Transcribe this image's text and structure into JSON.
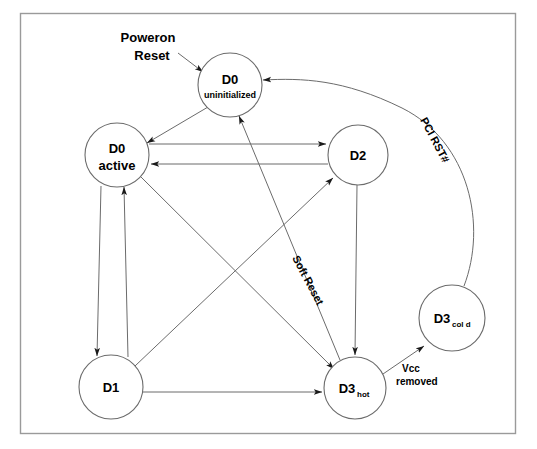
{
  "figure": {
    "frame": {
      "x": 20,
      "y": 13,
      "width": 496,
      "height": 421,
      "border_color": "#9a9a9a",
      "background": "#ffffff"
    },
    "stroke_color": "#6b6b6b",
    "node_stroke_color": "#6b6b6b",
    "text_color": "#000000"
  },
  "nodes": [
    {
      "id": "d0-uninitialized",
      "cx": 230,
      "cy": 85,
      "r": 32,
      "line1": "D0",
      "line2": "uninitialized",
      "line1_size": 13,
      "line2_size": 9
    },
    {
      "id": "d0-active",
      "cx": 117,
      "cy": 155,
      "r": 32,
      "line1": "D0",
      "line2": "active",
      "line1_size": 13,
      "line2_size": 13
    },
    {
      "id": "d2",
      "cx": 358,
      "cy": 155,
      "r": 30,
      "line1": "D2",
      "line2": "",
      "line1_size": 13,
      "line2_size": 0
    },
    {
      "id": "d3-cold",
      "cx": 452,
      "cy": 318,
      "r": 33,
      "line1": "D3",
      "line2": "",
      "subscript": "col d",
      "line1_size": 13,
      "line2_size": 0
    },
    {
      "id": "d1",
      "cx": 111,
      "cy": 387,
      "r": 32,
      "line1": "D1",
      "line2": "",
      "line1_size": 13,
      "line2_size": 0
    },
    {
      "id": "d3-hot",
      "cx": 355,
      "cy": 388,
      "r": 31,
      "line1": "D3",
      "line2": "",
      "subscript": "hot",
      "line1_size": 13,
      "line2_size": 0
    }
  ],
  "labels": [
    {
      "id": "poweron-reset",
      "line1": "Poweron",
      "line2": "Reset",
      "x": 148,
      "y": 42,
      "size": 13,
      "rotation": 0
    },
    {
      "id": "pci-rst",
      "text": "PCI RST#",
      "x": 420,
      "y": 120,
      "size": 11,
      "rotation": 62
    },
    {
      "id": "soft-reset",
      "text": "Soft Reset",
      "x": 292,
      "y": 258,
      "size": 11,
      "rotation": 62
    },
    {
      "id": "vcc-removed",
      "line1": "Vcc",
      "line2": "removed",
      "x": 402,
      "y": 372,
      "size": 10,
      "rotation": 0
    }
  ],
  "edges": [
    {
      "id": "poweron-reset-to-d0-uninitialized",
      "from": "entry",
      "to": "d0-uninitialized",
      "label": "Poweron Reset"
    },
    {
      "id": "d0-uninitialized-to-d0-active",
      "from": "d0-uninitialized",
      "to": "d0-active",
      "label": ""
    },
    {
      "id": "d0-active-to-d2",
      "from": "d0-active",
      "to": "d2",
      "label": ""
    },
    {
      "id": "d2-to-d0-active",
      "from": "d2",
      "to": "d0-active",
      "label": ""
    },
    {
      "id": "d0-active-to-d1",
      "from": "d0-active",
      "to": "d1",
      "label": ""
    },
    {
      "id": "d1-to-d0-active",
      "from": "d1",
      "to": "d0-active",
      "label": ""
    },
    {
      "id": "d0-active-to-d3-hot",
      "from": "d0-active",
      "to": "d3-hot",
      "label": "Soft Reset"
    },
    {
      "id": "d1-to-d2",
      "from": "d1",
      "to": "d2",
      "label": ""
    },
    {
      "id": "d1-to-d3-hot",
      "from": "d1",
      "to": "d3-hot",
      "label": ""
    },
    {
      "id": "d2-to-d3-hot",
      "from": "d2",
      "to": "d3-hot",
      "label": ""
    },
    {
      "id": "d3-hot-to-d0-uninitialized",
      "from": "d3-hot",
      "to": "d0-uninitialized",
      "label": ""
    },
    {
      "id": "d3-hot-to-d3-cold",
      "from": "d3-hot",
      "to": "d3-cold",
      "label": "Vcc removed"
    },
    {
      "id": "d3-cold-to-d0-uninitialized",
      "from": "d3-cold",
      "to": "d0-uninitialized",
      "label": "PCI RST#"
    }
  ]
}
